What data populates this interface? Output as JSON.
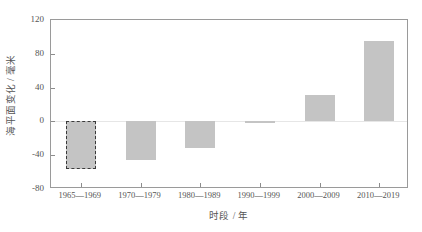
{
  "chart_data": {
    "type": "bar",
    "title": "",
    "subtitle": "",
    "xlabel": "时段 / 年",
    "ylabel": "海平面变化 / 毫米",
    "categories": [
      "1965—1969",
      "1970—1979",
      "1980—1989",
      "1990—1999",
      "2000—2009",
      "2010—2019"
    ],
    "values": [
      -56,
      -46,
      -32,
      -1,
      31,
      95
    ],
    "ylim": [
      -80,
      120
    ],
    "yticks": [
      "120",
      "80",
      "40",
      "0",
      "-40",
      "-80"
    ],
    "ytick_values": [
      120,
      80,
      40,
      0,
      -40,
      -80
    ],
    "grid": false,
    "legend": "none",
    "bar_color": "#c4c4c4",
    "highlight_bar_index": 0,
    "highlight_border": "dashed #3a3a3a",
    "axis_color": "#9a9a9a"
  },
  "axes": {
    "y_title": "海平面变化 / 毫米",
    "x_title": "时段 / 年"
  }
}
